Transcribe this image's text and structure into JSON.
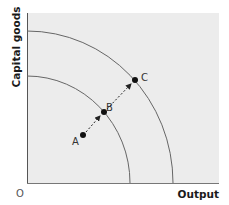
{
  "diagram": {
    "type": "production-possibility-frontier",
    "y_axis_label": "Capital goods",
    "x_axis_label": "Output",
    "origin_label": "O",
    "colors": {
      "plot_background": "#ececec",
      "axis": "#555555",
      "curve": "#666666",
      "point": "#111111",
      "arrow": "#222222"
    },
    "curves": [
      {
        "name": "inner-ppf",
        "x_intercept_px": 130,
        "y_intercept_px": 76
      },
      {
        "name": "outer-ppf",
        "x_intercept_px": 173,
        "y_intercept_px": 31
      }
    ],
    "points": [
      {
        "label": "A",
        "position": "inside inner curve"
      },
      {
        "label": "B",
        "position": "on inner curve"
      },
      {
        "label": "C",
        "position": "on outer curve"
      }
    ],
    "arrows": [
      {
        "from": "A",
        "to": "B",
        "style": "dashed"
      },
      {
        "from": "B",
        "to": "C",
        "style": "dashed"
      }
    ]
  }
}
